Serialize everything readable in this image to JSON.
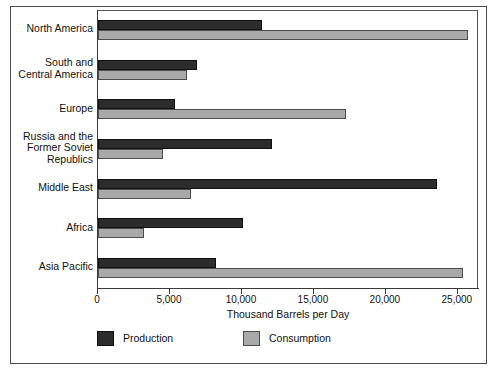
{
  "chart_data": {
    "type": "bar",
    "orientation": "horizontal",
    "title": "",
    "xlabel": "Thousand Barrels per Day",
    "ylabel": "",
    "xlim": [
      0,
      26400
    ],
    "xticks": [
      0,
      5000,
      10000,
      15000,
      20000,
      25000
    ],
    "xtick_labels": [
      "0",
      "5,000",
      "10,000",
      "15,000",
      "20,000",
      "25,000"
    ],
    "grid": false,
    "legend_position": "bottom-left",
    "categories": [
      "North America",
      "South and\nCentral America",
      "Europe",
      "Russia and the\nFormer Soviet\nRepublics",
      "Middle East",
      "Africa",
      "Asia Pacific"
    ],
    "series": [
      {
        "name": "Production",
        "color": "#2c2c2c",
        "values": [
          11425,
          6900,
          5350,
          12100,
          23550,
          10100,
          8200
        ]
      },
      {
        "name": "Consumption",
        "color": "#a9a9a9",
        "values": [
          25700,
          6150,
          17200,
          4550,
          6450,
          3200,
          25350
        ]
      }
    ]
  },
  "legend": {
    "items": [
      {
        "label": "Production"
      },
      {
        "label": "Consumption"
      }
    ]
  },
  "colors": {
    "production": "#2c2c2c",
    "consumption": "#a9a9a9",
    "frame": "#4a4a4a",
    "axis": "#3a3a3a",
    "text": "#111111",
    "background": "#ffffff"
  }
}
